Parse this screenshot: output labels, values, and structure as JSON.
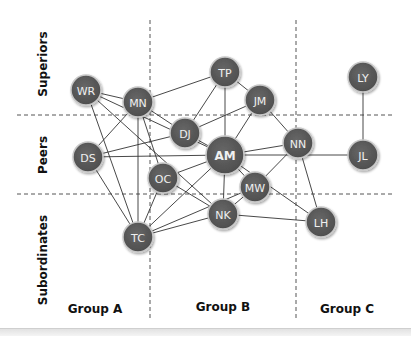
{
  "rows": [
    {
      "label": "Superiors"
    },
    {
      "label": "Peers"
    },
    {
      "label": "Subordinates"
    }
  ],
  "columns": [
    {
      "label": "Group A"
    },
    {
      "label": "Group B"
    },
    {
      "label": "Group C"
    }
  ],
  "colors": {
    "node_fill": "#5a5a5a",
    "node_stroke": "#c8c8c8",
    "node_text": "#f0f0f0",
    "edge": "#333333",
    "divider": "#555555"
  },
  "nodes": [
    {
      "id": "WR",
      "x": 86,
      "y": 90,
      "r": 15
    },
    {
      "id": "MN",
      "x": 138,
      "y": 102,
      "r": 15
    },
    {
      "id": "TP",
      "x": 225,
      "y": 72,
      "r": 15
    },
    {
      "id": "JM",
      "x": 260,
      "y": 100,
      "r": 15
    },
    {
      "id": "DJ",
      "x": 185,
      "y": 133,
      "r": 15
    },
    {
      "id": "AM",
      "x": 225,
      "y": 155,
      "r": 19
    },
    {
      "id": "NN",
      "x": 298,
      "y": 143,
      "r": 15
    },
    {
      "id": "LY",
      "x": 363,
      "y": 77,
      "r": 15
    },
    {
      "id": "JL",
      "x": 363,
      "y": 155,
      "r": 15
    },
    {
      "id": "DS",
      "x": 88,
      "y": 157,
      "r": 15
    },
    {
      "id": "OC",
      "x": 163,
      "y": 178,
      "r": 15
    },
    {
      "id": "MW",
      "x": 255,
      "y": 187,
      "r": 15
    },
    {
      "id": "NK",
      "x": 223,
      "y": 214,
      "r": 15
    },
    {
      "id": "LH",
      "x": 321,
      "y": 222,
      "r": 15
    },
    {
      "id": "TC",
      "x": 138,
      "y": 237,
      "r": 15
    }
  ],
  "edges": [
    [
      "WR",
      "MN"
    ],
    [
      "WR",
      "AM"
    ],
    [
      "WR",
      "TC"
    ],
    [
      "WR",
      "NK"
    ],
    [
      "MN",
      "TP"
    ],
    [
      "MN",
      "DJ"
    ],
    [
      "MN",
      "DS"
    ],
    [
      "MN",
      "OC"
    ],
    [
      "MN",
      "TC"
    ],
    [
      "TP",
      "DJ"
    ],
    [
      "TP",
      "AM"
    ],
    [
      "TP",
      "JM"
    ],
    [
      "JM",
      "DJ"
    ],
    [
      "JM",
      "AM"
    ],
    [
      "JM",
      "NN"
    ],
    [
      "DJ",
      "AM"
    ],
    [
      "DS",
      "DJ"
    ],
    [
      "DS",
      "AM"
    ],
    [
      "DS",
      "TC"
    ],
    [
      "AM",
      "NN"
    ],
    [
      "AM",
      "JL"
    ],
    [
      "AM",
      "LH"
    ],
    [
      "AM",
      "MW"
    ],
    [
      "AM",
      "NK"
    ],
    [
      "AM",
      "TC"
    ],
    [
      "AM",
      "OC"
    ],
    [
      "OC",
      "TC"
    ],
    [
      "OC",
      "NK"
    ],
    [
      "NN",
      "MW"
    ],
    [
      "NN",
      "LH"
    ],
    [
      "MW",
      "NK"
    ],
    [
      "MW",
      "TC"
    ],
    [
      "NK",
      "TC"
    ],
    [
      "NK",
      "LH"
    ],
    [
      "LY",
      "JL"
    ]
  ],
  "dividers": {
    "vertical_x": [
      150,
      296
    ],
    "horizontal_y": [
      115,
      194
    ],
    "v_top": 20,
    "v_bottom": 320,
    "h_left": 17,
    "h_right": 395
  }
}
